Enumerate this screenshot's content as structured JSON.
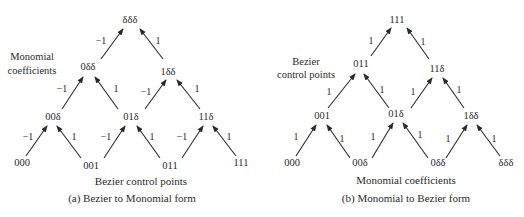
{
  "diagrams": [
    {
      "id": "a",
      "caption": "(a) Bezier to Monomial form",
      "side_label": [
        "Monomial",
        "coefficients"
      ],
      "bottom_label": "Bezier control points",
      "nodes": {
        "top": "δδδ",
        "mid_left": "0δδ",
        "mid_right": "1δδ",
        "low_left": "00δ",
        "low_mid": "01δ",
        "low_right": "11δ",
        "base_0": "000",
        "base_1": "001",
        "base_2": "011",
        "base_3": "111"
      },
      "weights": {
        "left": "−1",
        "right": "1"
      }
    },
    {
      "id": "b",
      "caption": "(b) Monomial to Bezier form",
      "side_label": [
        "Bezier",
        "control points"
      ],
      "bottom_label": "Monomial coefficients",
      "nodes": {
        "top": "111",
        "mid_left": "011",
        "mid_right": "11δ",
        "low_left": "001",
        "low_mid": "01δ",
        "low_right": "1δδ",
        "base_0": "000",
        "base_1": "00δ",
        "base_2": "0δδ",
        "base_3": "δδδ"
      },
      "weights": {
        "left": "1",
        "right": "1"
      }
    }
  ]
}
